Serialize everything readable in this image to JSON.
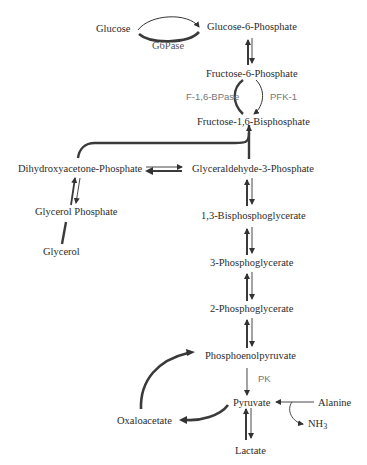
{
  "colors": {
    "text": "#2b2b2b",
    "enzyme_text": "#777777",
    "arrow": "#333333",
    "thick_arrow": "#3a3a3a"
  },
  "metabolites": {
    "glucose": "Glucose",
    "glucose_6_phosphate": "Glucose-6-Phosphate",
    "fructose_6_phosphate": "Fructose-6-Phosphate",
    "fructose_1_6_bisphosphate": "Fructose-1,6-Bisphosphate",
    "dihydroxyacetone_phosphate": "Dihydroxyacetone-Phosphate",
    "glyceraldehyde_3_phosphate": "Glyceraldehyde-3-Phosphate",
    "glycerol_phosphate": "Glycerol Phosphate",
    "glycerol": "Glycerol",
    "bisphosphoglycerate_1_3": "1,3-Bisphosphoglycerate",
    "phosphoglycerate_3": "3-Phosphoglycerate",
    "phosphoglycerate_2": "2-Phosphoglycerate",
    "phosphoenolpyruvate": "Phosphoenolpyruvate",
    "pyruvate": "Pyruvate",
    "oxaloacetate": "Oxaloacetate",
    "alanine": "Alanine",
    "ammonia": "NH",
    "ammonia_sub": "3",
    "lactate": "Lactate"
  },
  "enzymes": {
    "g6pase": "G6Pase",
    "f16bpase": "F-1,6-BPase",
    "pfk1": "PFK-1",
    "pk": "PK"
  }
}
